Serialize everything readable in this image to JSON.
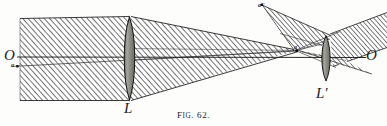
{
  "figure": {
    "caption_prefix": "F",
    "caption_prefix_rest": "IG",
    "caption_number": ". 62.",
    "caption_full": "FIG. 62.",
    "alt": "Optical ray diagram: a wide parallel beam from object O converges through lens L to a focus at the plane of lens L', and emerges as a tilted beam toward O on the right."
  },
  "labels": {
    "object_left": "O",
    "object_right": "O",
    "lens_main": "L",
    "lens_eye": "L'",
    "point_left": "a",
    "point_focus": "a'",
    "point_upper": "a''"
  },
  "elements": {
    "lens_main_name": "converging-lens-L",
    "lens_eye_name": "converging-lens-L-prime",
    "beam_incident_name": "incident-parallel-beam",
    "beam_converging_name": "converging-cone-beam",
    "beam_oblique_name": "oblique-beam",
    "beam_emergent_name": "emergent-beam",
    "axis_name": "optical-axis"
  },
  "colors": {
    "ink": "#1b1b1b",
    "hatch": "#3a3a3a",
    "lens_fill": "#8d8d86",
    "paper": "#fdfdfb",
    "axis": "#2a2a2a"
  },
  "geometry": {
    "width": 387,
    "height": 126,
    "axis_y": 57,
    "lens_main_x": 129,
    "lens_main_top": 18,
    "lens_main_bottom": 100,
    "lens_eye_x": 326,
    "lens_eye_top": 36,
    "lens_eye_bottom": 81,
    "focus_x": 297,
    "focus_y": 51,
    "beam_left_edge_x": 20,
    "beam_top_y": 18,
    "beam_bottom_y": 100
  }
}
